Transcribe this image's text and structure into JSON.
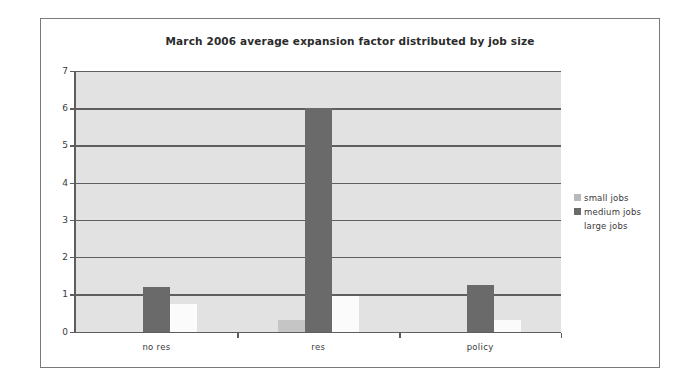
{
  "chart_data": {
    "type": "bar",
    "title": "March 2006 average expansion factor distributed by job size",
    "xlabel": "",
    "ylabel": "",
    "categories": [
      "no res",
      "res",
      "policy"
    ],
    "series": [
      {
        "name": "small jobs",
        "color": "#c5c5c5",
        "values": [
          0.0,
          0.3,
          0.0
        ]
      },
      {
        "name": "medium jobs",
        "color": "#6a6a6a",
        "values": [
          1.2,
          6.0,
          1.25
        ]
      },
      {
        "name": "large jobs",
        "color": "#fbfbfb",
        "values": [
          0.75,
          0.95,
          0.3
        ]
      }
    ],
    "ylim": [
      0,
      7
    ],
    "yticks": [
      0,
      1,
      2,
      3,
      4,
      5,
      6,
      7
    ],
    "ytick_labels": [
      "0",
      "1",
      "2",
      "3",
      "4",
      "5",
      "6",
      "7"
    ],
    "grid": true,
    "legend_position": "right",
    "plot_background": "#e2e2e2",
    "frame_color": "#7a7a7a"
  },
  "legend": {
    "items": [
      {
        "label": "small jobs"
      },
      {
        "label": "medium jobs"
      },
      {
        "label": "large jobs"
      }
    ]
  }
}
